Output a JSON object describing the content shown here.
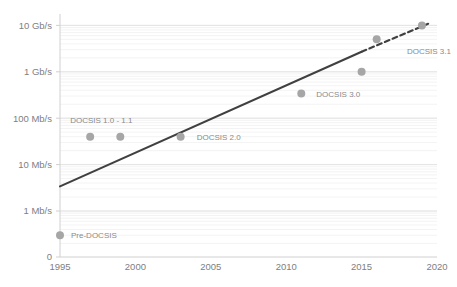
{
  "chart_data": {
    "type": "scatter",
    "title": "",
    "xlabel": "",
    "ylabel": "",
    "yscale": "log",
    "xlim": [
      1995,
      2020
    ],
    "ylim_mbps": [
      0.1,
      10000
    ],
    "grid": true,
    "legend": "none",
    "x_tick_labels": [
      "1995",
      "2000",
      "2005",
      "2010",
      "2015",
      "2020"
    ],
    "x_tick_values": [
      1995,
      2000,
      2005,
      2010,
      2015,
      2020
    ],
    "y_tick_labels": [
      "10 Gb/s",
      "1 Gb/s",
      "100 Mb/s",
      "10 Mb/s",
      "1 Mb/s",
      "0"
    ],
    "y_tick_values_mbps": [
      10000,
      1000,
      100,
      10,
      1,
      0
    ],
    "points": [
      {
        "label": "Pre-DOCSIS",
        "x": 1995,
        "y_mbps": 0.3,
        "label_dx": 11,
        "label_dy": 3
      },
      {
        "label": "DOCSIS 1.0 - 1.1",
        "x": 1997,
        "y_mbps": 40,
        "label_dx": -20,
        "label_dy": -14
      },
      {
        "label": "",
        "x": 1999,
        "y_mbps": 40,
        "label_dx": 0,
        "label_dy": 0
      },
      {
        "label": "DOCSIS 2.0",
        "x": 2003,
        "y_mbps": 40,
        "label_dx": 16,
        "label_dy": 3
      },
      {
        "label": "DOCSIS 3.0",
        "x": 2011,
        "y_mbps": 340,
        "label_dx": 15,
        "label_dy": 3
      },
      {
        "label": "",
        "x": 2015,
        "y_mbps": 1000,
        "label_dx": 0,
        "label_dy": 0
      },
      {
        "label": "",
        "x": 2016,
        "y_mbps": 5000,
        "label_dx": 0,
        "label_dy": 0
      },
      {
        "label": "DOCSIS 3.1",
        "x": 2019,
        "y_mbps": 10000,
        "label_dx": -15,
        "label_dy": 29
      }
    ],
    "trend_solid": {
      "x_start": 1995,
      "y_start_mbps": 3.4,
      "x_end": 2015.0,
      "y_end_mbps": 2700
    },
    "trend_dashed": {
      "x_start": 2015.0,
      "y_start_mbps": 2700,
      "x_end": 2019.6,
      "y_end_mbps": 11500
    },
    "colors": {
      "point": "#a6a6a6",
      "trend_line": "#404040",
      "gridline": "#ededed",
      "axis": "#d0d0d0",
      "tick_text": "#808080",
      "label_text": "#8a8a8a"
    }
  }
}
